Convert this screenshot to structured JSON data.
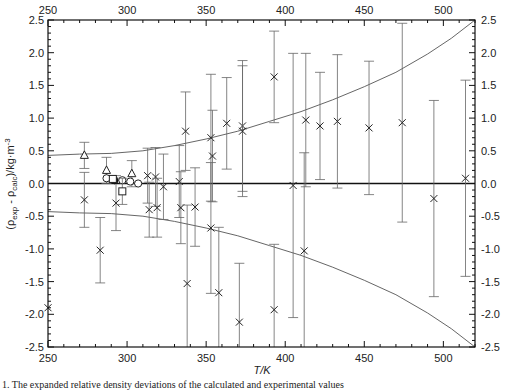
{
  "chart_data": {
    "type": "scatter",
    "title": "",
    "xlabel": "T/K",
    "ylabel": "(ρ_exp - ρ_calc)/kg·m-3",
    "ylabel_parts": {
      "open": "(ρ",
      "sub1": "exp",
      "mid": " - ρ",
      "sub2": "calc",
      "close": ")/kg·m",
      "sup": "-3"
    },
    "xlim": [
      250,
      520
    ],
    "ylim": [
      -2.5,
      2.5
    ],
    "xticks": [
      250,
      300,
      350,
      400,
      450,
      500
    ],
    "yticks": [
      -2.5,
      -2.0,
      -1.5,
      -1.0,
      -0.5,
      0.0,
      0.5,
      1.0,
      1.5,
      2.0,
      2.5
    ],
    "ytick_labels": [
      "-2.5",
      "-2.0",
      "-1.5",
      "-1.0",
      "-0.5",
      "0.0",
      "0.5",
      "1.0",
      "1.5",
      "2.0",
      "2.5"
    ],
    "grid": false,
    "zero_line": true,
    "uncertainty_band": {
      "description": "expanded uncertainty envelope",
      "upper": [
        [
          250,
          0.43
        ],
        [
          270,
          0.45
        ],
        [
          290,
          0.46
        ],
        [
          310,
          0.5
        ],
        [
          330,
          0.58
        ],
        [
          350,
          0.68
        ],
        [
          370,
          0.8
        ],
        [
          390,
          0.95
        ],
        [
          410,
          1.1
        ],
        [
          430,
          1.28
        ],
        [
          450,
          1.48
        ],
        [
          470,
          1.7
        ],
        [
          490,
          1.98
        ],
        [
          505,
          2.22
        ],
        [
          520,
          2.5
        ]
      ],
      "lower": [
        [
          250,
          -0.43
        ],
        [
          270,
          -0.45
        ],
        [
          290,
          -0.46
        ],
        [
          310,
          -0.5
        ],
        [
          330,
          -0.58
        ],
        [
          350,
          -0.68
        ],
        [
          370,
          -0.8
        ],
        [
          390,
          -0.95
        ],
        [
          410,
          -1.1
        ],
        [
          430,
          -1.28
        ],
        [
          450,
          -1.48
        ],
        [
          470,
          -1.7
        ],
        [
          490,
          -1.98
        ],
        [
          505,
          -2.22
        ],
        [
          520,
          -2.5
        ]
      ]
    },
    "series": [
      {
        "name": "cross",
        "marker": "x",
        "points": [
          {
            "x": 250,
            "y": -1.9,
            "err": null
          },
          {
            "x": 273,
            "y": -0.25,
            "err": 0.42
          },
          {
            "x": 283,
            "y": -1.02,
            "err": 0.5
          },
          {
            "x": 293,
            "y": -0.3,
            "err": 0.42
          },
          {
            "x": 313,
            "y": 0.12,
            "err": 0.42
          },
          {
            "x": 314,
            "y": -0.4,
            "err": 0.42
          },
          {
            "x": 318,
            "y": 0.1,
            "err": 0.45
          },
          {
            "x": 319,
            "y": -0.37,
            "err": 0.45
          },
          {
            "x": 323,
            "y": -0.05,
            "err": 0.5
          },
          {
            "x": 333,
            "y": 0.03,
            "err": 0.55
          },
          {
            "x": 334,
            "y": -0.37,
            "err": 0.55
          },
          {
            "x": 337,
            "y": 0.8,
            "err": 0.6
          },
          {
            "x": 338,
            "y": -1.53,
            "err": 1.2
          },
          {
            "x": 343,
            "y": -0.36,
            "err": 0.6
          },
          {
            "x": 353,
            "y": 0.7,
            "err": 0.97
          },
          {
            "x": 353,
            "y": -0.68,
            "err": 1.0
          },
          {
            "x": 354,
            "y": 0.42,
            "err": 0.7
          },
          {
            "x": 358,
            "y": -1.67,
            "err": 1.0
          },
          {
            "x": 363,
            "y": 0.92,
            "err": 0.7
          },
          {
            "x": 371,
            "y": -2.12,
            "err": 0.9
          },
          {
            "x": 373,
            "y": 0.88,
            "err": 1.0
          },
          {
            "x": 373,
            "y": 0.8,
            "err": 1.0
          },
          {
            "x": 393,
            "y": 1.63,
            "err": 0.7
          },
          {
            "x": 393,
            "y": -1.93,
            "err": 1.0
          },
          {
            "x": 405,
            "y": -0.03,
            "err": 2.02
          },
          {
            "x": 412,
            "y": -1.03,
            "err": 1.5
          },
          {
            "x": 413,
            "y": 0.97,
            "err": 1.02
          },
          {
            "x": 422,
            "y": 0.88,
            "err": 0.82
          },
          {
            "x": 433,
            "y": 0.95,
            "err": 1.02
          },
          {
            "x": 453,
            "y": 0.85,
            "err": 1.02
          },
          {
            "x": 474,
            "y": 0.93,
            "err": 1.52
          },
          {
            "x": 494,
            "y": -0.23,
            "err": 1.5
          },
          {
            "x": 514,
            "y": 0.08,
            "err": 1.5
          }
        ]
      },
      {
        "name": "triangle",
        "marker": "triangle",
        "points": [
          {
            "x": 273,
            "y": 0.43,
            "err": 0.2
          },
          {
            "x": 287,
            "y": 0.2,
            "err": 0.2
          },
          {
            "x": 303,
            "y": 0.15,
            "err": 0.2
          }
        ]
      },
      {
        "name": "circle",
        "marker": "circle",
        "points": [
          {
            "x": 287,
            "y": 0.08,
            "err": null
          },
          {
            "x": 297,
            "y": 0.05,
            "err": null
          },
          {
            "x": 302,
            "y": 0.03,
            "err": null
          },
          {
            "x": 307,
            "y": 0.0,
            "err": null
          }
        ]
      },
      {
        "name": "filled-circle",
        "marker": "filled-circle",
        "points": [
          {
            "x": 292,
            "y": 0.05,
            "err": null
          }
        ]
      },
      {
        "name": "square",
        "marker": "square",
        "points": [
          {
            "x": 297,
            "y": -0.12,
            "err": 0.2
          },
          {
            "x": 291,
            "y": 0.07,
            "err": null
          }
        ]
      }
    ]
  },
  "caption": "1. The expanded relative density deviations of the calculated and experimental values"
}
